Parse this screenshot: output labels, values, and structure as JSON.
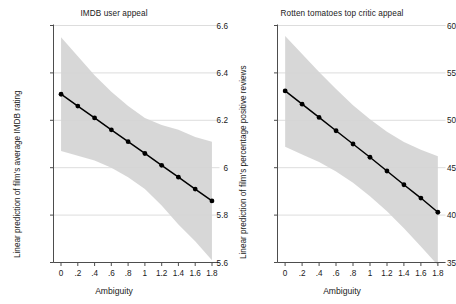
{
  "figure": {
    "background_color": "#ffffff",
    "band_color": "#d4d4d4",
    "line_color": "#000000",
    "marker_color": "#000000",
    "grid_color": "#d9d9d9",
    "axis_color": "#4d4d4d",
    "text_color": "#1a1a1a"
  },
  "chart_data": [
    {
      "type": "line",
      "panel": "left",
      "title": "IMDB user appeal",
      "xlabel": "Ambiguity",
      "ylabel": "Linear prediction of film's average IMDB rating",
      "x": [
        0,
        0.2,
        0.4,
        0.6,
        0.8,
        1.0,
        1.2,
        1.4,
        1.6,
        1.8
      ],
      "xtick_labels": [
        "0",
        ".2",
        ".4",
        ".6",
        ".8",
        "1",
        "1.2",
        "1.4",
        "1.6",
        "1.8"
      ],
      "ytick_values": [
        5.6,
        5.8,
        6.0,
        6.2,
        6.4,
        6.6
      ],
      "ytick_labels": [
        "5.6",
        "5.8",
        "6",
        "6.2",
        "6.4",
        "6.6"
      ],
      "xlim": [
        -0.09,
        1.89
      ],
      "ylim": [
        5.6,
        6.6
      ],
      "grid": "horizontal",
      "legend": "none",
      "series": [
        {
          "name": "Linear prediction",
          "values": [
            6.31,
            6.26,
            6.21,
            6.16,
            6.11,
            6.06,
            6.01,
            5.96,
            5.91,
            5.86
          ],
          "markers": true
        },
        {
          "name": "95% CI upper",
          "values": [
            6.55,
            6.47,
            6.39,
            6.32,
            6.26,
            6.21,
            6.18,
            6.16,
            6.13,
            6.11
          ],
          "markers": false
        },
        {
          "name": "95% CI lower",
          "values": [
            6.07,
            6.05,
            6.03,
            6.0,
            5.96,
            5.91,
            5.84,
            5.76,
            5.69,
            5.61
          ],
          "markers": false
        }
      ]
    },
    {
      "type": "line",
      "panel": "right",
      "title": "Rotten tomatoes top critic appeal",
      "xlabel": "Ambiguity",
      "ylabel": "Linear prediction of film's percentage positive reviews",
      "x": [
        0,
        0.2,
        0.4,
        0.6,
        0.8,
        1.0,
        1.2,
        1.4,
        1.6,
        1.8
      ],
      "xtick_labels": [
        "0",
        ".2",
        ".4",
        ".6",
        ".8",
        "1",
        "1.2",
        "1.4",
        "1.6",
        "1.8"
      ],
      "ytick_values": [
        35,
        40,
        45,
        50,
        55,
        60
      ],
      "ytick_labels": [
        "35",
        "40",
        "45",
        "50",
        "55",
        "60"
      ],
      "xlim": [
        -0.09,
        1.89
      ],
      "ylim": [
        35,
        60
      ],
      "grid": "horizontal",
      "legend": "none",
      "series": [
        {
          "name": "Linear prediction",
          "values": [
            53.1,
            51.7,
            50.3,
            48.9,
            47.5,
            46.1,
            44.65,
            43.2,
            41.8,
            40.3
          ],
          "markers": true
        },
        {
          "name": "95% CI upper",
          "values": [
            58.9,
            57.0,
            55.1,
            53.3,
            51.6,
            50.1,
            48.8,
            47.7,
            46.9,
            46.2
          ],
          "markers": false
        },
        {
          "name": "95% CI lower",
          "values": [
            47.2,
            46.4,
            45.6,
            44.6,
            43.4,
            42.0,
            40.4,
            38.6,
            36.7,
            34.7
          ],
          "markers": false
        }
      ]
    }
  ]
}
